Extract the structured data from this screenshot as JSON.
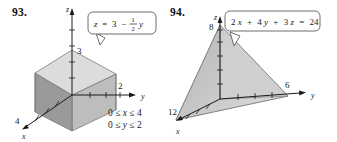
{
  "page": {
    "background": "#ffffff",
    "ink": "#1a1a1a"
  },
  "problems": [
    {
      "number": "93.",
      "equation_label": "z = 3 − ½y",
      "equation_parts": {
        "lhs": "z",
        "eq": "=",
        "const": "3",
        "minus": "−",
        "frac_num": "1",
        "frac_den": "2",
        "var": "y"
      },
      "axes": {
        "x_label": "x",
        "y_label": "y",
        "z_label": "z"
      },
      "tick_labels": {
        "z": "3",
        "y": "2",
        "x": "4"
      },
      "constraints": [
        {
          "lower": "0 ≤ ",
          "var": "x",
          "upper": " ≤ 4"
        },
        {
          "lower": "0 ≤ ",
          "var": "y",
          "upper": " ≤ 2"
        }
      ],
      "solid": "prism",
      "colors": {
        "top_face": "#d8d8d8",
        "left_face": "#9a9a9a",
        "right_face": "#bdbdbd",
        "outline": "#6d6d6d",
        "axis": "#1a1a1a",
        "callout_border": "#4a4a4a",
        "callout_fill": "#ffffff"
      }
    },
    {
      "number": "94.",
      "equation_label": "2x + 4y + 3z = 24",
      "equation_parts": {
        "t1c": "2",
        "t1v": "x",
        "p1": "+",
        "t2c": "4",
        "t2v": "y",
        "p2": "+",
        "t3c": "3",
        "t3v": "z",
        "eq": "=",
        "rhs": "24"
      },
      "axes": {
        "x_label": "x",
        "y_label": "y",
        "z_label": "z"
      },
      "tick_labels": {
        "z": "8",
        "y": "6",
        "x": "12"
      },
      "constraints": [],
      "solid": "tetrahedron",
      "colors": {
        "front_face": "#c9c9c9",
        "left_face": "#b0b0b0",
        "bottom_face": "#dcdcdc",
        "outline": "#6d6d6d",
        "axis": "#1a1a1a",
        "callout_border": "#4a4a4a",
        "callout_fill": "#ffffff"
      }
    }
  ]
}
